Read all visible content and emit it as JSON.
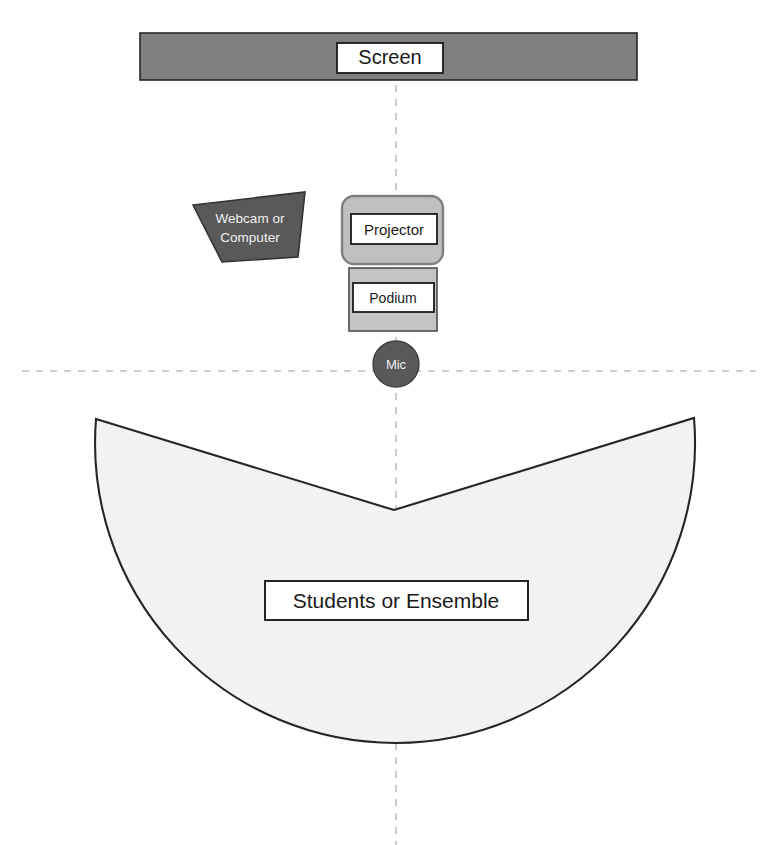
{
  "diagram": {
    "background_color": "#FFFFFF",
    "width": 772,
    "height": 845,
    "colors": {
      "screen_fill": "#808080",
      "screen_stroke": "#262626",
      "webcam_fill": "#595959",
      "webcam_stroke": "#333333",
      "projector_fill": "#BFBFBF",
      "projector_stroke": "#7F7F7F",
      "podium_fill": "#C4C4C4",
      "podium_stroke": "#4D4D4D",
      "mic_fill": "#595959",
      "mic_stroke": "#404040",
      "audience_fill": "#F2F2F2",
      "audience_stroke": "#262626",
      "label_box_fill": "#FFFFFF",
      "label_box_stroke": "#1A1A1A",
      "axis_dash_color": "#BFBFBF",
      "label_text_dark": "#1A1A1A",
      "label_text_light": "#F0F0F0"
    },
    "elements": {
      "screen": {
        "label": "Screen",
        "shape": "rectangle",
        "x": 140,
        "y": 33,
        "w": 497,
        "h": 47,
        "label_box": {
          "x": 337,
          "y": 43,
          "w": 106,
          "h": 30
        },
        "label_font_size": 20
      },
      "webcam": {
        "label_line1": "Webcam or",
        "label_line2": "Computer",
        "shape": "polygon",
        "points": "193,205 305,192 298,257 222,262",
        "label_font_size": 13.5,
        "label_x": 250,
        "label_y1": 220,
        "label_y2": 239
      },
      "projector": {
        "label": "Projector",
        "shape": "rounded-rectangle",
        "x": 342,
        "y": 196,
        "w": 101,
        "h": 68,
        "r": 12,
        "label_box": {
          "x": 351,
          "y": 214,
          "w": 86,
          "h": 30
        },
        "label_font_size": 15
      },
      "podium": {
        "label": "Podium",
        "shape": "rectangle",
        "x": 349,
        "y": 268,
        "w": 88,
        "h": 63,
        "label_box": {
          "x": 353,
          "y": 283,
          "w": 81,
          "h": 29
        },
        "label_font_size": 14
      },
      "mic": {
        "label": "Mic",
        "shape": "circle",
        "cx": 396,
        "cy": 364,
        "r": 23,
        "label_font_size": 13
      },
      "audience": {
        "label": "Students or Ensemble",
        "shape": "circle-with-v-notch",
        "cx": 396,
        "cy": 505,
        "r": 300,
        "notch_left": "96,419",
        "notch_apex": "394,510",
        "notch_right": "694,418",
        "label_box": {
          "x": 265,
          "y": 581,
          "w": 263,
          "h": 39
        },
        "label_font_size": 21
      },
      "center_axis_vertical": {
        "name": "vertical-center-axis",
        "x": 396,
        "y1": 43,
        "y2": 845
      },
      "center_axis_horizontal": {
        "name": "horizontal-center-axis",
        "y": 371,
        "x1": 22,
        "x2": 756
      }
    }
  }
}
